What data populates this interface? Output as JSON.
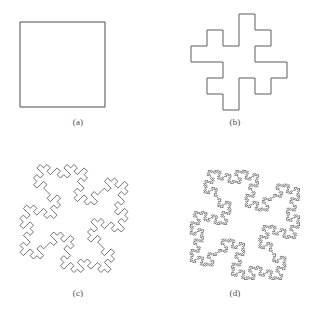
{
  "figure": {
    "background_color": "#ffffff",
    "stroke_color": "#4d4d4d",
    "caption_color": "#4a4a4a"
  },
  "panels": [
    {
      "id": "a",
      "caption": "(a)",
      "name": "panel-a-initiator-square",
      "iteration": 0,
      "shape_name": "square-initiator",
      "rotation_deg": 0,
      "stroke_width": 1.0,
      "box": {
        "x": 20,
        "y": 22,
        "w": 85,
        "h": 85
      },
      "segment_count": 4
    },
    {
      "id": "b",
      "caption": "(b)",
      "name": "panel-b-iteration-1",
      "iteration": 1,
      "shape_name": "quadratic-koch-island-level-1",
      "rotation_deg": 0,
      "stroke_width": 0.9,
      "box": {
        "x": 181,
        "y": 14,
        "w": 116,
        "h": 96
      },
      "segment_count": 32
    },
    {
      "id": "c",
      "caption": "(c)",
      "name": "panel-c-iteration-2",
      "iteration": 2,
      "shape_name": "quadratic-koch-island-level-2",
      "rotation_deg": 45,
      "stroke_width": 0.8,
      "box": {
        "x": 20,
        "y": 164,
        "w": 108,
        "h": 109
      },
      "segment_count": 256
    },
    {
      "id": "d",
      "caption": "(d)",
      "name": "panel-d-iteration-3",
      "iteration": 3,
      "shape_name": "quadratic-koch-island-level-3",
      "rotation_deg": 45,
      "stroke_width": 0.8,
      "box": {
        "x": 190,
        "y": 170,
        "w": 110,
        "h": 110
      },
      "segment_count": 2048
    }
  ],
  "chart_data": {
    "type": "line",
    "xlabel": "",
    "ylabel": "",
    "categories": [
      "(a)",
      "(b)",
      "(c)",
      "(d)"
    ],
    "series": [
      {
        "name": "iteration",
        "values": [
          0,
          1,
          2,
          3
        ]
      },
      {
        "name": "segments",
        "values": [
          4,
          32,
          256,
          2048
        ]
      }
    ],
    "generator": {
      "name": "quadratic-koch-generator",
      "description": "Each straight segment is replaced by 8 sub-segments of length 1/4, producing a square bump up then a square bump down.",
      "turns_deg": [
        0,
        90,
        -90,
        -90,
        0,
        90,
        90,
        -90,
        0
      ],
      "scale_factor": 0.25,
      "sub_segments": 8,
      "fractal_dimension": 1.5
    },
    "legend_position": "none",
    "grid": false
  }
}
